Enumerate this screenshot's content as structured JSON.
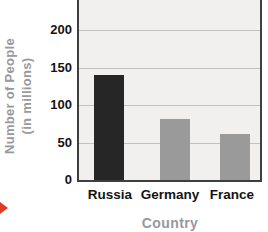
{
  "chart_data": {
    "type": "bar",
    "title": "",
    "categories": [
      "Russia",
      "Germany",
      "France"
    ],
    "values": [
      140,
      82,
      62
    ],
    "xlabel": "Country",
    "ylabel": "Number of People (in millions)",
    "ylabel_line1": "Number of People",
    "ylabel_line2": "(in millions)",
    "yticks": [
      0,
      50,
      100,
      150,
      200
    ],
    "ylim": [
      0,
      240
    ],
    "grid": "horizontal",
    "legend": "none",
    "bar_colors": [
      "#262626",
      "#9a9a9a",
      "#9a9a9a"
    ],
    "note": "plot area cropped at top of image above the 200 gridline"
  },
  "colors": {
    "page_background": "#ffffff",
    "plot_background": "#f1f0ee",
    "gridline": "#c2c2c2",
    "axis_border": "#3f3f3f",
    "tick_text": "#141414",
    "axis_title_text": "#97999c",
    "page_marker": "#df3b26"
  }
}
